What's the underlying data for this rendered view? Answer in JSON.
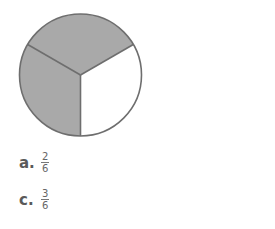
{
  "diagram": {
    "type": "fraction-circle",
    "parts": 3,
    "shaded_parts": 2,
    "colors": {
      "shaded": "#a9a9a9",
      "unshaded": "#ffffff",
      "stroke": "#6e6e6e"
    }
  },
  "options": [
    {
      "label": "a.",
      "numerator": "2",
      "denominator": "6"
    },
    {
      "label": "c.",
      "numerator": "3",
      "denominator": "6"
    }
  ]
}
